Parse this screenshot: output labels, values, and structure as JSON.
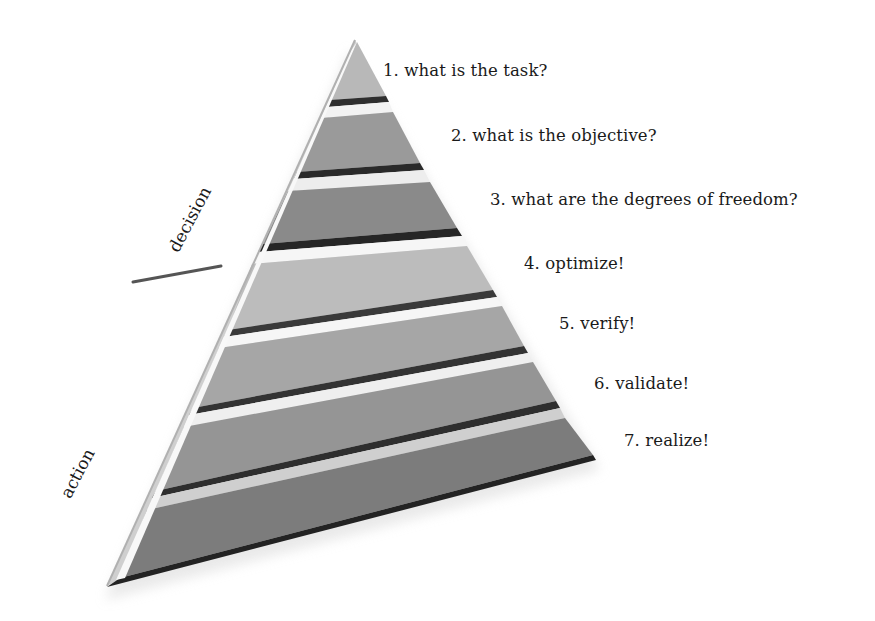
{
  "diagram": {
    "type": "pyramid",
    "steps": [
      {
        "label": "1. what is the task?",
        "fill": "#b8b8b8"
      },
      {
        "label": "2. what is the objective?",
        "fill": "#9a9a9a"
      },
      {
        "label": "3. what are the degrees of freedom?",
        "fill": "#8a8a8a"
      },
      {
        "label": "4. optimize!",
        "fill": "#bcbcbc"
      },
      {
        "label": "5. verify!",
        "fill": "#a6a6a6"
      },
      {
        "label": "6. validate!",
        "fill": "#959595"
      },
      {
        "label": "7. realize!",
        "fill": "#7c7c7c"
      }
    ],
    "side_labels": {
      "top": "decision",
      "bottom": "action"
    },
    "colors": {
      "dark_edge": "#2a2a2a",
      "bevel_light": "#f4f4f4",
      "divider": "#555555",
      "text": "#1a1a1a"
    }
  }
}
